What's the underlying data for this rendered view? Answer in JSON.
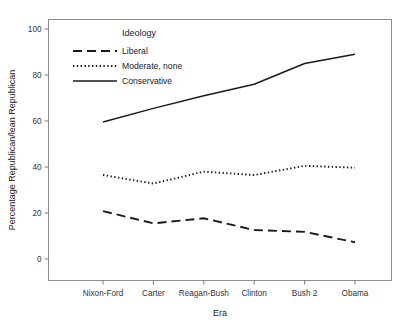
{
  "chart_data": {
    "type": "line",
    "title": "",
    "xlabel": "Era",
    "ylabel": "Percentage Republican/lean Republican",
    "categories": [
      "Nixon-Ford",
      "Carter",
      "Reagan-Bush",
      "Clinton",
      "Bush 2",
      "Obama"
    ],
    "xlim": [
      0,
      5
    ],
    "ylim": [
      0,
      100
    ],
    "yticks": [
      0,
      20,
      40,
      60,
      80,
      100
    ],
    "ytick_labels": [
      "0",
      "20",
      "40",
      "60",
      "80",
      "100"
    ],
    "grid": false,
    "legend": {
      "title": "Ideology",
      "position": "upper-left-inside",
      "entries": [
        {
          "name": "Liberal",
          "style": "dashed"
        },
        {
          "name": "Moderate, none",
          "style": "dotted"
        },
        {
          "name": "Conservative",
          "style": "solid"
        }
      ]
    },
    "series": [
      {
        "name": "Liberal",
        "style": "dashed",
        "values": [
          20.8,
          15.5,
          17.7,
          12.6,
          11.8,
          7.3
        ]
      },
      {
        "name": "Moderate, none",
        "style": "dotted",
        "values": [
          36.5,
          32.8,
          38.0,
          36.5,
          40.5,
          39.7
        ]
      },
      {
        "name": "Conservative",
        "style": "solid",
        "values": [
          59.6,
          65.5,
          71.0,
          76.0,
          85.0,
          89.0
        ]
      }
    ]
  },
  "colors": {
    "line": "#1a1a1a",
    "frame": "#8c8c8c",
    "background": "#ffffff",
    "tick_label": "#333333"
  }
}
